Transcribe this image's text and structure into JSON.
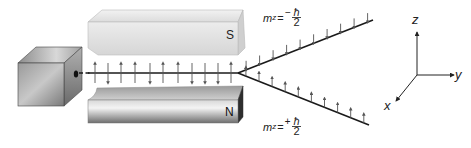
{
  "figure": {
    "source_label": "oven",
    "magnets": {
      "top": {
        "pole": "S"
      },
      "bottom": {
        "pole": "N"
      }
    },
    "beams": {
      "upper": {
        "label_var": "m",
        "label_sub": "z",
        "label_eq": "=",
        "label_sign": "−",
        "label_num": "ħ",
        "label_den": "2"
      },
      "lower": {
        "label_var": "m",
        "label_sub": "z",
        "label_eq": "=",
        "label_sign": "+",
        "label_num": "ħ",
        "label_den": "2"
      }
    },
    "incoming_spins": [
      "up",
      "down",
      "up",
      "up",
      "down",
      "up",
      "up",
      "down",
      "down",
      "down",
      "up"
    ],
    "axes": {
      "x": "x",
      "y": "y",
      "z": "z"
    },
    "colors": {
      "beam": "#1a1a1a",
      "arrow": "#555555",
      "magnet_light": "#e6e6e6",
      "magnet_dark": "#6f6f6f",
      "cube": "#8a8a8a"
    }
  }
}
